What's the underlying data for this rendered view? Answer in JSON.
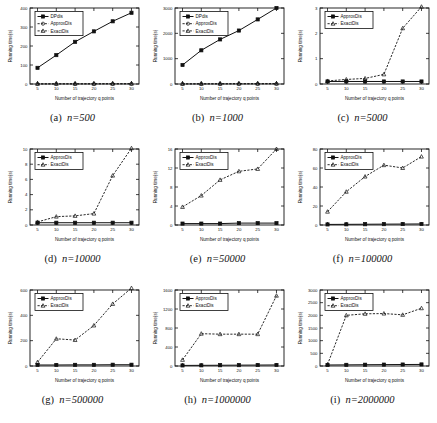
{
  "figure": {
    "bottom_caption": "",
    "xlabel": "Number of trajectory q points",
    "ylabel": "Running time(s)",
    "xticks": [
      5,
      10,
      15,
      20,
      25,
      30
    ],
    "series_names": {
      "dp": "DPdis",
      "approx": "ApproxDis",
      "exact": "ExactDis"
    }
  },
  "panels": [
    {
      "tag": "(a)",
      "nlabel": "n=500",
      "caption": "(a)  n=500"
    },
    {
      "tag": "(b)",
      "nlabel": "n=1000",
      "caption": "(b)  n=1000"
    },
    {
      "tag": "(c)",
      "nlabel": "n=5000",
      "caption": "(c)  n=5000"
    },
    {
      "tag": "(d)",
      "nlabel": "n=10000",
      "caption": "(d)  n=10000"
    },
    {
      "tag": "(e)",
      "nlabel": "n=50000",
      "caption": "(e)  n=50000"
    },
    {
      "tag": "(f)",
      "nlabel": "n=100000",
      "caption": "(f)  n=100000"
    },
    {
      "tag": "(g)",
      "nlabel": "n=500000",
      "caption": "(g)  n=500000"
    },
    {
      "tag": "(h)",
      "nlabel": "n=1000000",
      "caption": "(h)  n=1000000"
    },
    {
      "tag": "(i)",
      "nlabel": "n=2000000",
      "caption": "(i)  n=2000000"
    }
  ],
  "chart_data": [
    {
      "type": "line",
      "panel": "(a)",
      "title": "(a) n=500",
      "xlabel": "Number of trajectory q points",
      "ylabel": "Running time(s)",
      "x": [
        5,
        10,
        15,
        20,
        25,
        30
      ],
      "xlim": [
        3,
        32
      ],
      "ylim": [
        0,
        400
      ],
      "yticks": [
        0,
        100,
        200,
        300,
        400
      ],
      "grid": false,
      "legend_position": "upper left",
      "series": [
        {
          "name": "DPdis",
          "style": "solid",
          "marker": "square",
          "values": [
            85,
            152,
            222,
            277,
            330,
            375
          ]
        },
        {
          "name": "ApproxDis",
          "style": "dashed",
          "marker": "circle",
          "values": [
            0.4,
            0.5,
            0.6,
            0.7,
            0.8,
            0.9
          ]
        },
        {
          "name": "ExactDis",
          "style": "dashed",
          "marker": "triangle",
          "values": [
            0.8,
            1.0,
            1.1,
            1.3,
            1.5,
            1.7
          ]
        }
      ]
    },
    {
      "type": "line",
      "panel": "(b)",
      "title": "(b) n=1000",
      "xlabel": "Number of trajectory q points",
      "ylabel": "Running time(s)",
      "x": [
        5,
        10,
        15,
        20,
        25,
        30
      ],
      "xlim": [
        3,
        32
      ],
      "ylim": [
        0,
        3000
      ],
      "yticks": [
        0,
        1000,
        2000,
        3000
      ],
      "grid": false,
      "legend_position": "upper left",
      "series": [
        {
          "name": "DPdis",
          "style": "solid",
          "marker": "square",
          "values": [
            750,
            1330,
            1760,
            2110,
            2550,
            3000
          ]
        },
        {
          "name": "ApproxDis",
          "style": "dashed",
          "marker": "circle",
          "values": [
            3,
            4,
            5,
            6,
            7,
            8
          ]
        },
        {
          "name": "ExactDis",
          "style": "dashed",
          "marker": "triangle",
          "values": [
            6,
            8,
            10,
            12,
            14,
            16
          ]
        }
      ]
    },
    {
      "type": "line",
      "panel": "(c)",
      "title": "(c) n=5000",
      "xlabel": "Number of trajectory q points",
      "ylabel": "Running time(s)",
      "x": [
        5,
        10,
        15,
        20,
        25,
        30
      ],
      "xlim": [
        3,
        32
      ],
      "ylim": [
        0,
        3
      ],
      "yticks": [
        0,
        1,
        2,
        3
      ],
      "grid": false,
      "legend_position": "upper left",
      "series": [
        {
          "name": "ApproxDis",
          "style": "solid",
          "marker": "square",
          "values": [
            0.1,
            0.1,
            0.1,
            0.1,
            0.1,
            0.1
          ]
        },
        {
          "name": "ExactDis",
          "style": "dashed",
          "marker": "triangle",
          "values": [
            0.12,
            0.18,
            0.22,
            0.38,
            2.2,
            3.05
          ]
        }
      ]
    },
    {
      "type": "line",
      "panel": "(d)",
      "title": "(d) n=10000",
      "xlabel": "Number of trajectory q points",
      "ylabel": "Running time(s)",
      "x": [
        5,
        10,
        15,
        20,
        25,
        30
      ],
      "xlim": [
        3,
        32
      ],
      "ylim": [
        0,
        10
      ],
      "yticks": [
        0,
        2,
        4,
        6,
        8,
        10
      ],
      "grid": false,
      "legend_position": "upper left",
      "series": [
        {
          "name": "ApproxDis",
          "style": "solid",
          "marker": "square",
          "values": [
            0.3,
            0.3,
            0.3,
            0.3,
            0.3,
            0.3
          ]
        },
        {
          "name": "ExactDis",
          "style": "dashed",
          "marker": "triangle",
          "values": [
            0.4,
            1.1,
            1.2,
            1.5,
            6.5,
            10.1
          ]
        }
      ]
    },
    {
      "type": "line",
      "panel": "(e)",
      "title": "(e) n=50000",
      "xlabel": "Number of trajectory q points",
      "ylabel": "Running time(s)",
      "x": [
        5,
        10,
        15,
        20,
        25,
        30
      ],
      "xlim": [
        3,
        32
      ],
      "ylim": [
        0,
        16
      ],
      "yticks": [
        0,
        4,
        8,
        12,
        16
      ],
      "grid": false,
      "legend_position": "upper left",
      "series": [
        {
          "name": "ApproxDis",
          "style": "solid",
          "marker": "square",
          "values": [
            0.3,
            0.3,
            0.3,
            0.4,
            0.4,
            0.4
          ]
        },
        {
          "name": "ExactDis",
          "style": "dashed",
          "marker": "triangle",
          "values": [
            3.8,
            6.2,
            9.5,
            11.3,
            11.8,
            16.0
          ]
        }
      ]
    },
    {
      "type": "line",
      "panel": "(f)",
      "title": "(f) n=100000",
      "xlabel": "Number of trajectory q points",
      "ylabel": "Running time(s)",
      "x": [
        5,
        10,
        15,
        20,
        25,
        30
      ],
      "xlim": [
        3,
        32
      ],
      "ylim": [
        0,
        80
      ],
      "yticks": [
        0,
        20,
        40,
        60,
        80
      ],
      "grid": false,
      "legend_position": "upper left",
      "series": [
        {
          "name": "ApproxDis",
          "style": "solid",
          "marker": "square",
          "values": [
            0.6,
            0.7,
            0.8,
            0.9,
            1.0,
            1.1
          ]
        },
        {
          "name": "ExactDis",
          "style": "dashed",
          "marker": "triangle",
          "values": [
            14,
            35,
            51,
            63,
            60,
            72
          ]
        }
      ]
    },
    {
      "type": "line",
      "panel": "(g)",
      "title": "(g) n=500000",
      "xlabel": "Number of trajectory q points",
      "ylabel": "Running time(s)",
      "x": [
        5,
        10,
        15,
        20,
        25,
        30
      ],
      "xlim": [
        3,
        32
      ],
      "ylim": [
        0,
        600
      ],
      "yticks": [
        0,
        200,
        400,
        600
      ],
      "grid": false,
      "legend_position": "upper left",
      "series": [
        {
          "name": "ApproxDis",
          "style": "solid",
          "marker": "square",
          "values": [
            8,
            8,
            9,
            9,
            10,
            10
          ]
        },
        {
          "name": "ExactDis",
          "style": "dashed",
          "marker": "triangle",
          "values": [
            30,
            215,
            205,
            320,
            490,
            615
          ]
        }
      ]
    },
    {
      "type": "line",
      "panel": "(h)",
      "title": "(h) n=1000000",
      "xlabel": "Number of trajectory q points",
      "ylabel": "Running time(s)",
      "x": [
        5,
        10,
        15,
        20,
        25,
        30
      ],
      "xlim": [
        3,
        32
      ],
      "ylim": [
        0,
        1600
      ],
      "yticks": [
        0,
        400,
        800,
        1200,
        1600
      ],
      "grid": false,
      "legend_position": "upper left",
      "series": [
        {
          "name": "ApproxDis",
          "style": "solid",
          "marker": "square",
          "values": [
            12,
            14,
            16,
            18,
            20,
            22
          ]
        },
        {
          "name": "ExactDis",
          "style": "dashed",
          "marker": "triangle",
          "values": [
            130,
            680,
            670,
            670,
            670,
            1480
          ]
        }
      ]
    },
    {
      "type": "line",
      "panel": "(i)",
      "title": "(i) n=2000000",
      "xlabel": "Number of trajectory q points",
      "ylabel": "Running time(s)",
      "x": [
        5,
        10,
        15,
        20,
        25,
        30
      ],
      "xlim": [
        3,
        32
      ],
      "ylim": [
        0,
        3000
      ],
      "yticks": [
        0,
        500,
        1000,
        1500,
        2000,
        2500,
        3000
      ],
      "grid": false,
      "legend_position": "upper left",
      "series": [
        {
          "name": "ApproxDis",
          "style": "solid",
          "marker": "square",
          "values": [
            40,
            45,
            50,
            55,
            58,
            62
          ]
        },
        {
          "name": "ExactDis",
          "style": "dashed",
          "marker": "triangle",
          "values": [
            60,
            2000,
            2060,
            2070,
            2020,
            2280
          ]
        }
      ]
    }
  ]
}
